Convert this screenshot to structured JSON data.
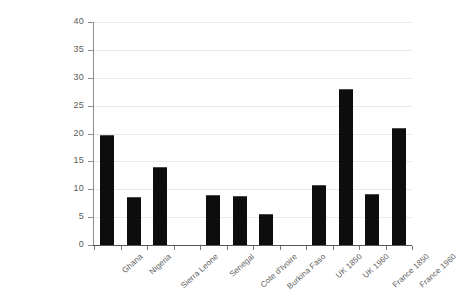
{
  "chart_data": {
    "type": "bar",
    "title": "",
    "subtitle": "",
    "xlabel": "",
    "ylabel": "",
    "ylim": [
      0,
      40
    ],
    "yticks": [
      0,
      5,
      10,
      15,
      20,
      25,
      30,
      35,
      40
    ],
    "grid": true,
    "legend": "none",
    "bar_color": "#0d0d0d",
    "gridline_color": "#e9e9e9",
    "axis_color": "#8d8d8d",
    "categories": [
      "Ghana",
      "Nigeria",
      "Sierra Leone",
      "",
      "Senegal",
      "Cote d'Ivoire",
      "Burkina Faso",
      "",
      "UK 1850",
      "UK 1960",
      "France 1850",
      "France 1960"
    ],
    "values": [
      19.8,
      8.6,
      14.0,
      null,
      9.0,
      8.8,
      5.5,
      null,
      10.8,
      28.0,
      9.2,
      21.0
    ]
  }
}
